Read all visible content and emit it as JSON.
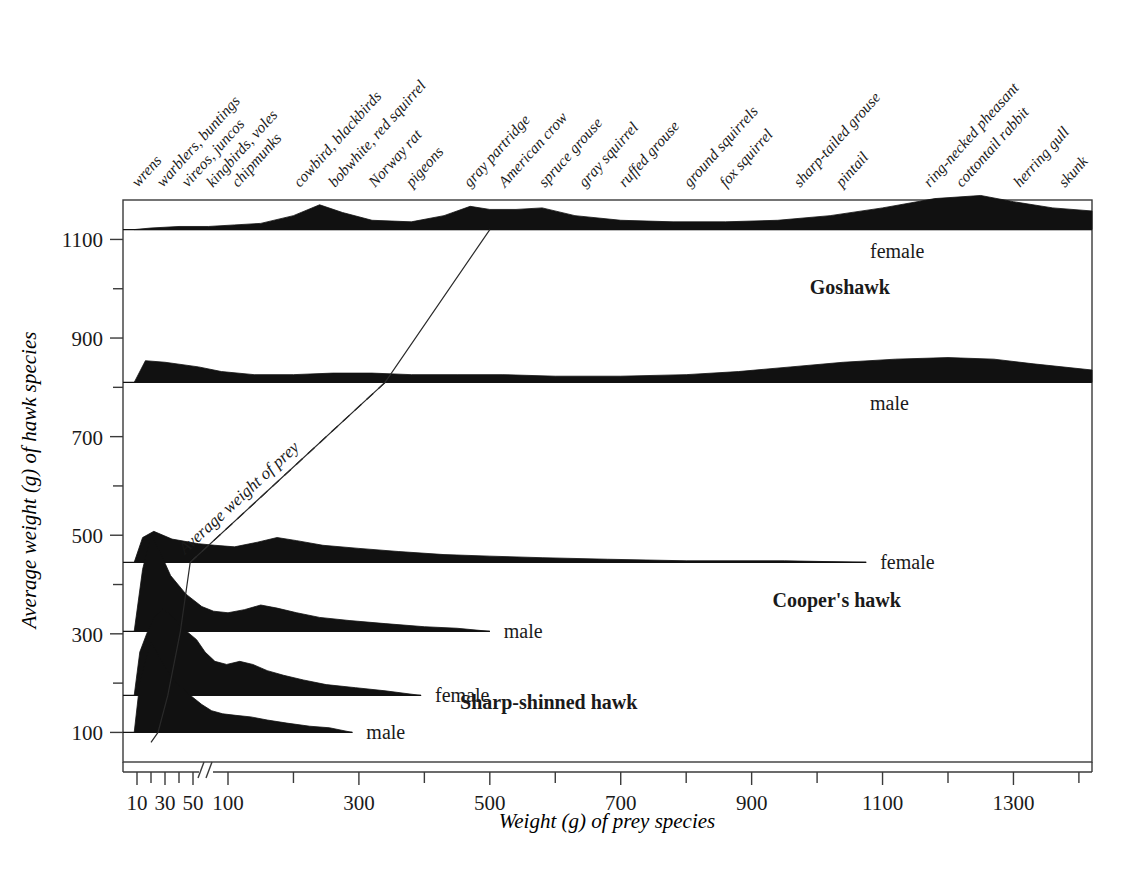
{
  "chart_data": {
    "type": "area",
    "title": "",
    "xlabel": "Weight (g) of prey species",
    "ylabel": "Average weight (g) of hawk species",
    "xlim": [
      0,
      1420
    ],
    "ylim": [
      40,
      1180
    ],
    "grid": false,
    "legend_position": "inline-right",
    "x_ticks_labeled": [
      10,
      30,
      50,
      100,
      300,
      500,
      700,
      900,
      1100,
      1300
    ],
    "x_ticks_minor": [
      20,
      40,
      200,
      400,
      600,
      800,
      1000,
      1200,
      1400
    ],
    "x_axis_break_after": 50,
    "y_ticks_labeled": [
      100,
      300,
      500,
      700,
      900,
      1100
    ],
    "y_ticks_minor": [
      200,
      400,
      600,
      800,
      1000
    ],
    "prey_categories": [
      "wrens",
      "warblers, buntings",
      "vireos, juncos",
      "kingbirds, voles",
      "chipmunks",
      "cowbird, blackbirds",
      "bobwhite, red squirrel",
      "Norway rat",
      "pigeons",
      "gray partridge",
      "American crow",
      "spruce grouse",
      "gray squirrel",
      "ruffed grouse",
      "ground squirrels",
      "fox squirrel",
      "sharp-tailed grouse",
      "pintail",
      "ring-necked pheasant",
      "cottontail rabbit",
      "herring gull",
      "skunk"
    ],
    "series": [
      {
        "name": "Goshawk female",
        "species": "Goshawk",
        "sex": "female",
        "hawk_weight": 1120,
        "sex_label": "female",
        "baseline_end": 1420,
        "density": [
          [
            8,
            0
          ],
          [
            20,
            1
          ],
          [
            40,
            2
          ],
          [
            70,
            2
          ],
          [
            110,
            3
          ],
          [
            150,
            4
          ],
          [
            200,
            9
          ],
          [
            240,
            16
          ],
          [
            275,
            11
          ],
          [
            320,
            6
          ],
          [
            380,
            5
          ],
          [
            430,
            9
          ],
          [
            470,
            15
          ],
          [
            500,
            13
          ],
          [
            540,
            13
          ],
          [
            580,
            14
          ],
          [
            630,
            9
          ],
          [
            700,
            6
          ],
          [
            780,
            5
          ],
          [
            860,
            5
          ],
          [
            940,
            6
          ],
          [
            1020,
            9
          ],
          [
            1100,
            14
          ],
          [
            1180,
            20
          ],
          [
            1250,
            22
          ],
          [
            1300,
            18
          ],
          [
            1360,
            14
          ],
          [
            1420,
            12
          ]
        ]
      },
      {
        "name": "Goshawk male",
        "species": "Goshawk",
        "sex": "male",
        "hawk_weight": 810,
        "sex_label": "male",
        "baseline_end": 1420,
        "density": [
          [
            8,
            0
          ],
          [
            16,
            14
          ],
          [
            30,
            13
          ],
          [
            55,
            10
          ],
          [
            90,
            7
          ],
          [
            140,
            5
          ],
          [
            200,
            5
          ],
          [
            260,
            6
          ],
          [
            320,
            6
          ],
          [
            380,
            5
          ],
          [
            450,
            5
          ],
          [
            520,
            5
          ],
          [
            600,
            4
          ],
          [
            700,
            4
          ],
          [
            800,
            5
          ],
          [
            880,
            7
          ],
          [
            960,
            10
          ],
          [
            1040,
            13
          ],
          [
            1120,
            15
          ],
          [
            1200,
            16
          ],
          [
            1270,
            15
          ],
          [
            1330,
            12
          ],
          [
            1420,
            8
          ]
        ]
      },
      {
        "name": "Cooper's hawk female",
        "species": "Cooper's hawk",
        "sex": "female",
        "hawk_weight": 445,
        "sex_label": "female",
        "baseline_end": 1075,
        "density": [
          [
            8,
            0
          ],
          [
            14,
            16
          ],
          [
            22,
            20
          ],
          [
            35,
            15
          ],
          [
            55,
            12
          ],
          [
            80,
            11
          ],
          [
            110,
            10
          ],
          [
            145,
            13
          ],
          [
            175,
            16
          ],
          [
            205,
            14
          ],
          [
            245,
            11
          ],
          [
            300,
            9
          ],
          [
            360,
            7
          ],
          [
            430,
            5
          ],
          [
            500,
            4
          ],
          [
            580,
            3
          ],
          [
            680,
            2
          ],
          [
            800,
            1
          ],
          [
            950,
            1
          ],
          [
            1075,
            0
          ]
        ]
      },
      {
        "name": "Cooper's hawk male",
        "species": "Cooper's hawk",
        "sex": "male",
        "hawk_weight": 305,
        "sex_label": "male",
        "baseline_end": 500,
        "density": [
          [
            8,
            0
          ],
          [
            14,
            40
          ],
          [
            20,
            62
          ],
          [
            26,
            52
          ],
          [
            34,
            36
          ],
          [
            45,
            24
          ],
          [
            60,
            16
          ],
          [
            78,
            13
          ],
          [
            100,
            12
          ],
          [
            125,
            14
          ],
          [
            150,
            17
          ],
          [
            175,
            15
          ],
          [
            205,
            12
          ],
          [
            240,
            9
          ],
          [
            285,
            7
          ],
          [
            340,
            5
          ],
          [
            400,
            3
          ],
          [
            450,
            2
          ],
          [
            500,
            0
          ]
        ]
      },
      {
        "name": "Sharp-shinned hawk female",
        "species": "Sharp-shinned hawk",
        "sex": "female",
        "hawk_weight": 175,
        "sex_label": "female",
        "baseline_end": 395,
        "density": [
          [
            8,
            0
          ],
          [
            12,
            28
          ],
          [
            17,
            40
          ],
          [
            22,
            50
          ],
          [
            28,
            56
          ],
          [
            34,
            52
          ],
          [
            42,
            44
          ],
          [
            52,
            36
          ],
          [
            65,
            28
          ],
          [
            80,
            22
          ],
          [
            98,
            20
          ],
          [
            118,
            22
          ],
          [
            138,
            20
          ],
          [
            160,
            16
          ],
          [
            185,
            13
          ],
          [
            215,
            10
          ],
          [
            250,
            7
          ],
          [
            295,
            5
          ],
          [
            340,
            3
          ],
          [
            395,
            0
          ]
        ]
      },
      {
        "name": "Sharp-shinned hawk male",
        "species": "Sharp-shinned hawk",
        "sex": "male",
        "hawk_weight": 100,
        "sex_label": "male",
        "baseline_end": 290,
        "density": [
          [
            8,
            0
          ],
          [
            12,
            32
          ],
          [
            16,
            46
          ],
          [
            20,
            58
          ],
          [
            24,
            52
          ],
          [
            30,
            42
          ],
          [
            38,
            32
          ],
          [
            48,
            24
          ],
          [
            60,
            18
          ],
          [
            75,
            14
          ],
          [
            92,
            12
          ],
          [
            112,
            11
          ],
          [
            135,
            10
          ],
          [
            160,
            8
          ],
          [
            190,
            6
          ],
          [
            225,
            4
          ],
          [
            255,
            3
          ],
          [
            290,
            0
          ]
        ]
      }
    ],
    "trend_annotation": {
      "label": "Average weight of prey",
      "points": [
        [
          20,
          80
        ],
        [
          25,
          100
        ],
        [
          32,
          175
        ],
        [
          41,
          305
        ],
        [
          48,
          445
        ],
        [
          340,
          810
        ],
        [
          500,
          1120
        ]
      ]
    },
    "species_labels": [
      {
        "text": "Goshawk",
        "at_x_value": 1050,
        "at_y_value": 990
      },
      {
        "text": "Cooper's hawk",
        "at_x_value": 1030,
        "at_y_value": 355
      },
      {
        "text": "Sharp-shinned hawk",
        "at_x_value": 590,
        "at_y_value": 148
      }
    ]
  },
  "figure": {
    "background": "#ffffff",
    "ink_color": "#111111",
    "axis_color": "#3a3a3a"
  }
}
